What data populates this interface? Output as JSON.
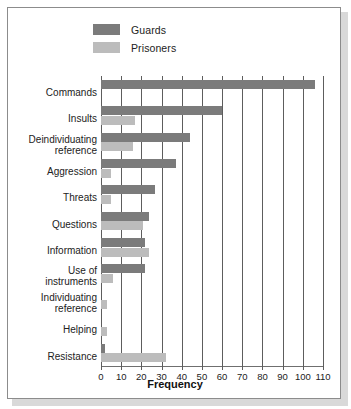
{
  "chart_data": {
    "type": "bar",
    "orientation": "horizontal",
    "title": "",
    "xlabel": "Frequency",
    "ylabel": "",
    "xlim": [
      0,
      110
    ],
    "xticks": [
      0,
      10,
      20,
      30,
      40,
      50,
      60,
      70,
      80,
      90,
      100,
      110
    ],
    "grid": "vertical",
    "legend_position": "top-left",
    "categories": [
      "Commands",
      "Insults",
      "Deindividuating\nreference",
      "Aggression",
      "Threats",
      "Questions",
      "Information",
      "Use of\ninstruments",
      "Individuating\nreference",
      "Helping",
      "Resistance"
    ],
    "series": [
      {
        "name": "Guards",
        "color": "#7b7b7b",
        "values": [
          106,
          60,
          44,
          37,
          27,
          24,
          22,
          22,
          0,
          0,
          2
        ]
      },
      {
        "name": "Prisoners",
        "color": "#bcbcbc",
        "values": [
          0,
          17,
          16,
          5,
          5,
          21,
          24,
          6,
          3,
          3,
          32
        ]
      }
    ]
  },
  "legend": {
    "items": [
      {
        "label": "Guards",
        "color": "#7b7b7b"
      },
      {
        "label": "Prisoners",
        "color": "#bcbcbc"
      }
    ]
  },
  "axis": {
    "x_title": "Frequency",
    "tick_labels": [
      "0",
      "10",
      "20",
      "30",
      "40",
      "50",
      "60",
      "70",
      "80",
      "90",
      "100",
      "110"
    ]
  },
  "colors": {
    "guards": "#7b7b7b",
    "prisoners": "#bcbcbc",
    "gridline": "#5d5d5d",
    "frame": "#8c8c8c",
    "shadow": "#d9d9d9",
    "background": "#ffffff"
  }
}
